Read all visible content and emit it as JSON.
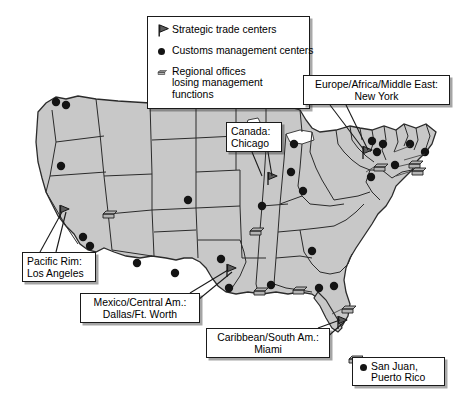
{
  "legend": {
    "title": "",
    "items": [
      {
        "symbol": "flag-icon",
        "label": "Strategic trade centers"
      },
      {
        "symbol": "filled-circle-icon",
        "label": "Customs management centers"
      },
      {
        "symbol": "rectangle-icon",
        "label": "Regional offices\nlosing management\nfunctions"
      }
    ],
    "item3_line1": "Regional offices",
    "item3_line2": "losing management",
    "item3_line3": "functions"
  },
  "callouts": [
    {
      "id": "europe-africa-middle-east",
      "line1": "Europe/Africa/Middle East:",
      "line2": "New York"
    },
    {
      "id": "canada",
      "line1": "Canada:",
      "line2": "Chicago"
    },
    {
      "id": "pacific-rim",
      "line1": "Pacific Rim:",
      "line2": "Los Angeles"
    },
    {
      "id": "mexico-central-america",
      "line1": "Mexico/Central Am.:",
      "line2": "Dallas/Ft. Worth"
    },
    {
      "id": "caribbean-south-america",
      "line1": "Caribbean/South Am.:",
      "line2": "Miami"
    }
  ],
  "inset": {
    "line1": "San Juan,",
    "line2": "Puerto Rico"
  },
  "caption": "",
  "colors": {
    "map_fill": "#c8c8c8",
    "map_border": "#2b2b2b",
    "marker": "#141414",
    "box_border": "#1a1a1a",
    "background": "#ffffff"
  },
  "map_data": {
    "type": "map",
    "region": "United States",
    "strategic_trade_centers": [
      {
        "name": "Los Angeles",
        "x": 63,
        "y": 211
      },
      {
        "name": "Dallas/Ft. Worth",
        "x": 229,
        "y": 272
      },
      {
        "name": "Chicago",
        "x": 270,
        "y": 178
      },
      {
        "name": "New York",
        "x": 366,
        "y": 152
      },
      {
        "name": "Miami",
        "x": 341,
        "y": 322
      }
    ],
    "customs_management_centers": [
      {
        "x": 61,
        "y": 166
      },
      {
        "x": 83,
        "y": 237
      },
      {
        "x": 89,
        "y": 246
      },
      {
        "x": 56,
        "y": 102
      },
      {
        "x": 67,
        "y": 105
      },
      {
        "x": 188,
        "y": 200
      },
      {
        "x": 137,
        "y": 263
      },
      {
        "x": 175,
        "y": 273
      },
      {
        "x": 221,
        "y": 259
      },
      {
        "x": 229,
        "y": 288
      },
      {
        "x": 262,
        "y": 206
      },
      {
        "x": 291,
        "y": 172
      },
      {
        "x": 294,
        "y": 144
      },
      {
        "x": 303,
        "y": 191
      },
      {
        "x": 312,
        "y": 251
      },
      {
        "x": 271,
        "y": 285
      },
      {
        "x": 334,
        "y": 286
      },
      {
        "x": 319,
        "y": 288
      },
      {
        "x": 372,
        "y": 141
      },
      {
        "x": 377,
        "y": 152
      },
      {
        "x": 382,
        "y": 144
      },
      {
        "x": 410,
        "y": 144
      },
      {
        "x": 371,
        "y": 177
      },
      {
        "x": 395,
        "y": 165
      },
      {
        "x": 425,
        "y": 152
      }
    ],
    "regional_offices": [
      {
        "x": 108,
        "y": 215
      },
      {
        "x": 256,
        "y": 232
      },
      {
        "x": 261,
        "y": 292
      },
      {
        "x": 299,
        "y": 291
      },
      {
        "x": 348,
        "y": 310
      },
      {
        "x": 380,
        "y": 168
      },
      {
        "x": 415,
        "y": 165
      },
      {
        "x": 418,
        "y": 172
      },
      {
        "x": 355,
        "y": 360
      },
      {
        "x": 368,
        "y": 176
      }
    ]
  }
}
